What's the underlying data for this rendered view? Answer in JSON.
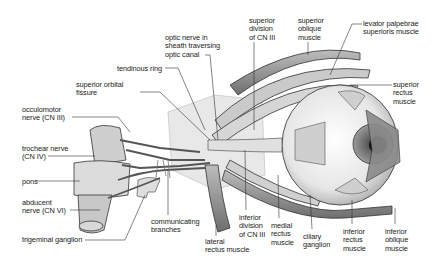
{
  "diagram": {
    "labels": [
      {
        "id": "optic_nerve",
        "text": "optic nerve in\nsheath traversing\noptic canal",
        "x": 165,
        "y": 34
      },
      {
        "id": "tendinous_ring",
        "text": "tendinous ring",
        "x": 117,
        "y": 65
      },
      {
        "id": "superior_orbital_fissure",
        "text": "superior orbital\nfissure",
        "x": 76,
        "y": 81
      },
      {
        "id": "occulomotor",
        "text": "occulomotor\nnerve (CN III)",
        "x": 22,
        "y": 106
      },
      {
        "id": "trochlear",
        "text": "trochear nerve\n(CN IV)",
        "x": 22,
        "y": 145
      },
      {
        "id": "pons",
        "text": "pons",
        "x": 22,
        "y": 178
      },
      {
        "id": "abducent",
        "text": "abducent\nnerve (CN VI)",
        "x": 22,
        "y": 199
      },
      {
        "id": "trigeminal",
        "text": "trigeminal ganglion",
        "x": 22,
        "y": 236
      },
      {
        "id": "communicating",
        "text": "communicating\nbranches",
        "x": 151,
        "y": 218
      },
      {
        "id": "lateral_rectus",
        "text": "lateral\nrectus muscle",
        "x": 205,
        "y": 238
      },
      {
        "id": "inferior_division",
        "text": "inferior\ndivision\nof CN III",
        "x": 239,
        "y": 214
      },
      {
        "id": "medial_rectus",
        "text": "medial\nrectus\nmuscle",
        "x": 271,
        "y": 222
      },
      {
        "id": "ciliary_ganglion",
        "text": "ciliary\nganglion",
        "x": 303,
        "y": 233
      },
      {
        "id": "inferior_rectus",
        "text": "inferior\nrectus\nmuscle",
        "x": 343,
        "y": 228
      },
      {
        "id": "inferior_oblique",
        "text": "inferior\noblique\nmuscle",
        "x": 385,
        "y": 228
      },
      {
        "id": "superior_division",
        "text": "superior\ndivision\nof CN III",
        "x": 249,
        "y": 17
      },
      {
        "id": "superior_oblique",
        "text": "superior\noblique\nmuscle",
        "x": 298,
        "y": 17
      },
      {
        "id": "levator",
        "text": "levator palpebrae\nsuperioris muscle",
        "x": 363,
        "y": 20
      },
      {
        "id": "superior_rectus",
        "text": "superior\nrectus\nmuscle",
        "x": 393,
        "y": 81
      }
    ]
  }
}
